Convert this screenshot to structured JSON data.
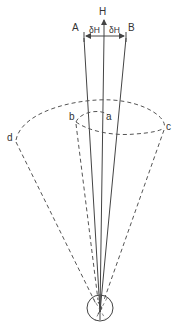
{
  "diagram": {
    "labels": {
      "A": "A",
      "B": "B",
      "H": "H",
      "deltaH_left": "δH",
      "deltaH_right": "δH",
      "a": "a",
      "b": "b",
      "c": "c",
      "d": "d"
    },
    "colors": {
      "line": "#444444",
      "dashed": "#555555",
      "text": "#333333",
      "background": "#ffffff"
    }
  }
}
